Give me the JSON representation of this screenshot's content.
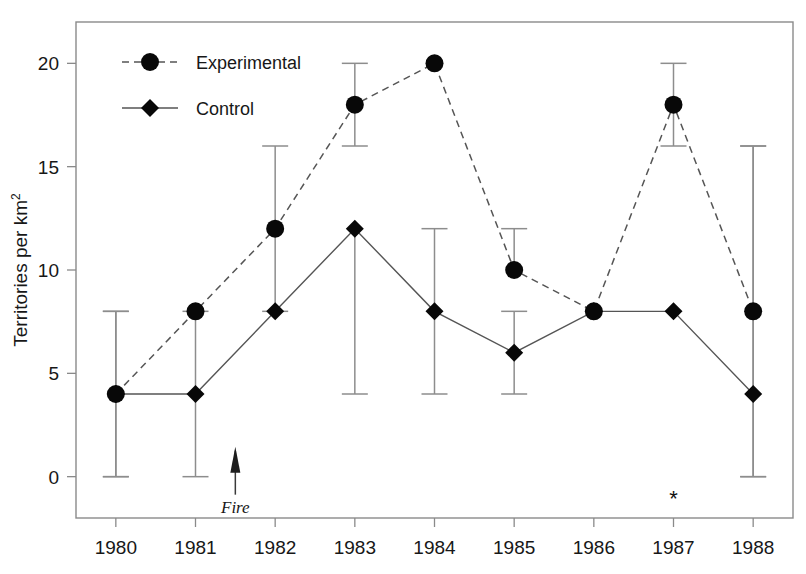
{
  "chart_data": {
    "type": "line",
    "title": "",
    "xlabel": "",
    "ylabel": "Territories per km2",
    "ylabel_base": "Territories per km",
    "ylabel_exponent": "2",
    "categories": [
      "1980",
      "1981",
      "1982",
      "1983",
      "1984",
      "1985",
      "1986",
      "1987",
      "1988"
    ],
    "x": [
      1980,
      1981,
      1982,
      1983,
      1984,
      1985,
      1986,
      1987,
      1988
    ],
    "xlim": [
      1979.5,
      1988.5
    ],
    "ylim": [
      -2,
      22
    ],
    "yticks": [
      0,
      5,
      10,
      15,
      20
    ],
    "ytick_labels": [
      "0",
      "5",
      "10",
      "15",
      "20"
    ],
    "grid": false,
    "legend_position": "top-left",
    "series": [
      {
        "name": "Experimental",
        "marker": "circle",
        "linestyle": "dashed",
        "values": [
          4,
          8,
          12,
          18,
          20,
          10,
          8,
          18,
          8
        ],
        "err_low": [
          0,
          null,
          8,
          16,
          null,
          null,
          null,
          16,
          0
        ],
        "err_high": [
          8,
          null,
          16,
          20,
          null,
          12,
          null,
          20,
          16
        ]
      },
      {
        "name": "Control",
        "marker": "diamond",
        "linestyle": "solid",
        "values": [
          4,
          4,
          8,
          12,
          8,
          6,
          8,
          8,
          4
        ],
        "err_low": [
          0,
          0,
          null,
          4,
          4,
          4,
          null,
          null,
          0
        ],
        "err_high": [
          8,
          8,
          null,
          null,
          12,
          8,
          null,
          null,
          16
        ]
      }
    ],
    "annotations": [
      {
        "name": "fire-arrow",
        "label": "Fire",
        "x": 1981.5,
        "y": 0,
        "type": "arrow-up"
      },
      {
        "name": "significance-star",
        "label": "*",
        "x": 1987,
        "y": -1.4,
        "type": "text"
      }
    ]
  },
  "legend": {
    "items": [
      {
        "label": "Experimental",
        "marker": "circle",
        "linestyle": "dashed"
      },
      {
        "label": "Control",
        "marker": "diamond",
        "linestyle": "solid"
      }
    ]
  },
  "colors": {
    "marker": "#080808",
    "line": "#555555",
    "errorbar": "#8d8d8d",
    "axis": "#8a8a8a",
    "text": "#171717",
    "background": "#ffffff"
  }
}
